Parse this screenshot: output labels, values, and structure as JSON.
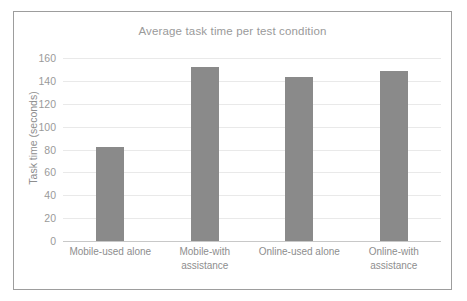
{
  "chart_data": {
    "type": "bar",
    "title": "Average task time per test condition",
    "xlabel": "",
    "ylabel": "Task time (seconds)",
    "categories": [
      "Mobile-used alone",
      "Mobile-with assistance",
      "Online-used alone",
      "Online-with assistance"
    ],
    "category_lines": [
      [
        "Mobile-used alone"
      ],
      [
        "Mobile-with",
        "assistance"
      ],
      [
        "Online-used alone"
      ],
      [
        "Online-with",
        "assistance"
      ]
    ],
    "values": [
      82,
      152,
      143,
      149
    ],
    "ylim": [
      0,
      160
    ],
    "ytick_labels": [
      "160",
      "140",
      "120",
      "100",
      "80",
      "60",
      "40",
      "20",
      "0"
    ],
    "ytick_values": [
      160,
      140,
      120,
      100,
      80,
      60,
      40,
      20,
      0
    ],
    "grid": true,
    "legend": false,
    "bar_color": "#8a8a8a",
    "gridline_color": "#e9e9e9",
    "axis_color": "#c8c8c8",
    "text_color": "#8e8e8e",
    "frame_color": "#9d9d9d",
    "background_color": "#ffffff"
  }
}
